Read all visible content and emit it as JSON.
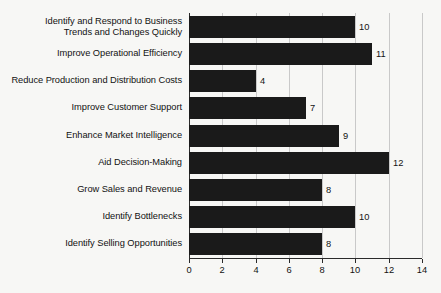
{
  "chart_data": {
    "type": "bar",
    "orientation": "horizontal",
    "title": "",
    "subtitle": "",
    "xlabel": "",
    "ylabel": "",
    "xlim": [
      0,
      14
    ],
    "xticks": [
      0,
      2,
      4,
      6,
      8,
      10,
      12,
      14
    ],
    "xtick_labels": [
      "0",
      "2",
      "4",
      "6",
      "8",
      "10",
      "12",
      "14"
    ],
    "grid": true,
    "legend": null,
    "bar_color": "#1a1a1a",
    "background_color": "#f7f7f5",
    "gridline_color": "#c9c9c9",
    "axis_color": "#2a2a2a",
    "categories": [
      "Identify and Respond to Business Trends and Changes Quickly",
      "Improve Operational Efficiency",
      "Reduce Production and Distribution Costs",
      "Improve Customer Support",
      "Enhance Market Intelligence",
      "Aid Decision-Making",
      "Grow Sales and Revenue",
      "Identify Bottlenecks",
      "Identify Selling Opportunities"
    ],
    "category_lines": [
      [
        "Identify and Respond to Business",
        "Trends and Changes Quickly"
      ],
      [
        "Improve Operational Efficiency"
      ],
      [
        "Reduce Production and Distribution Costs"
      ],
      [
        "Improve Customer Support"
      ],
      [
        "Enhance Market Intelligence"
      ],
      [
        "Aid Decision-Making"
      ],
      [
        "Grow Sales and Revenue"
      ],
      [
        "Identify Bottlenecks"
      ],
      [
        "Identify Selling Opportunities"
      ]
    ],
    "values": [
      10,
      11,
      4,
      7,
      9,
      12,
      8,
      10,
      8
    ],
    "value_labels": [
      "10",
      "11",
      "4",
      "7",
      "9",
      "12",
      "8",
      "10",
      "8"
    ]
  }
}
